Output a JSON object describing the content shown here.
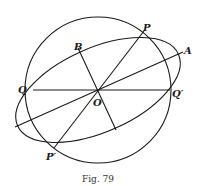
{
  "figure": {
    "caption": "Fig. 79",
    "labels": {
      "P": "P",
      "P_prime": "P′",
      "A": "A",
      "B": "B",
      "O": "O",
      "Q": "Q",
      "Q_prime": "Q′"
    },
    "elements": [
      "circle",
      "ellipse",
      "major-axis OA",
      "minor-axis OB",
      "diameter PP′",
      "diameter QQ′"
    ]
  }
}
